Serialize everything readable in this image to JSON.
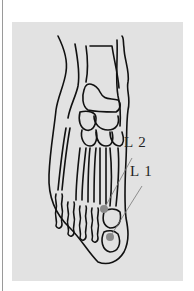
{
  "figure": {
    "type": "anatomical foot diagram (dorsal view, bones)",
    "background_color": "#e2e2e2",
    "point_color": "#8a8a8a",
    "points": [
      {
        "label": "L 2",
        "x": 104,
        "y": 209
      },
      {
        "label": "L 1",
        "x": 110,
        "y": 237
      }
    ]
  }
}
